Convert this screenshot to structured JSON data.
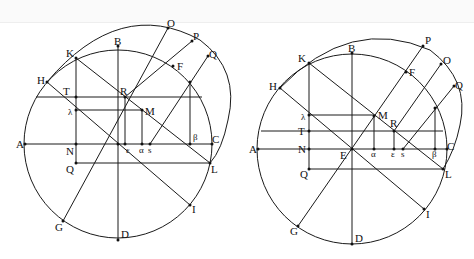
{
  "header": {
    "text": ""
  },
  "figures": [
    {
      "id": "left",
      "labels": {
        "O": "O",
        "P": "P",
        "Q_top": "Q",
        "K": "K",
        "B": "B",
        "H": "H",
        "F": "F",
        "T": "T",
        "R": "R",
        "lambda": "λ",
        "M": "M",
        "A": "A",
        "N": "N",
        "epsilon": "ε",
        "alpha": "α",
        "s": "s",
        "beta": "β",
        "C": "C",
        "Q": "Q",
        "L": "L",
        "I": "I",
        "G": "G",
        "D": "D"
      }
    },
    {
      "id": "right",
      "labels": {
        "P": "P",
        "O": "O",
        "Q_top": "Q",
        "K": "K",
        "B": "B",
        "H": "H",
        "F": "F",
        "lambda": "λ",
        "M": "M",
        "R": "R",
        "T": "T",
        "A": "A",
        "N": "N",
        "E": "E",
        "alpha": "α",
        "epsilon": "ε",
        "s": "s",
        "beta": "β",
        "C": "C",
        "Q": "Q",
        "L": "L",
        "I": "I",
        "G": "G",
        "D": "D"
      }
    }
  ]
}
